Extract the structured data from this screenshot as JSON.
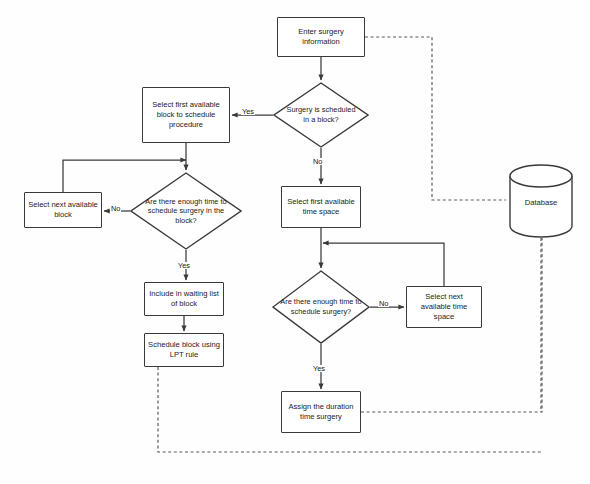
{
  "diagram": {
    "type": "flowchart",
    "background_color": "#fefefe",
    "stroke_color": "#3a3a3a",
    "text_color": "#1a1a1a"
  },
  "nodes": [
    {
      "id": "enter_surgery",
      "shape": "process",
      "label": "Enter surgery information",
      "x": 277,
      "y": 17,
      "w": 88,
      "h": 40
    },
    {
      "id": "surgery_scheduled",
      "shape": "decision",
      "label": "Surgery is scheduled in a block?",
      "x": 273,
      "y": 82,
      "w": 96,
      "h": 66
    },
    {
      "id": "select_first_block",
      "shape": "process",
      "label": "Select first available block to schedule procedure",
      "x": 142,
      "y": 87,
      "w": 88,
      "h": 56
    },
    {
      "id": "enough_time_block",
      "shape": "decision",
      "label": "Are there enough time to schedule surgery in the block?",
      "x": 130,
      "y": 172,
      "w": 112,
      "h": 78
    },
    {
      "id": "select_next_block",
      "shape": "process",
      "label": "Select next available block",
      "x": 24,
      "y": 192,
      "w": 78,
      "h": 36
    },
    {
      "id": "include_waiting",
      "shape": "process",
      "label": "Include in waiting list of block",
      "x": 144,
      "y": 282,
      "w": 80,
      "h": 34
    },
    {
      "id": "schedule_lpt",
      "shape": "process",
      "label": "Schedule block using LPT rule",
      "x": 144,
      "y": 333,
      "w": 80,
      "h": 34
    },
    {
      "id": "select_first_time",
      "shape": "process",
      "label": "Select first available time space",
      "x": 281,
      "y": 186,
      "w": 80,
      "h": 42
    },
    {
      "id": "enough_time_surg",
      "shape": "decision",
      "label": "Are there enough time to schedule surgery?",
      "x": 272,
      "y": 270,
      "w": 98,
      "h": 74
    },
    {
      "id": "select_next_time",
      "shape": "process",
      "label": "Select next available time space",
      "x": 406,
      "y": 286,
      "w": 76,
      "h": 42
    },
    {
      "id": "assign_duration",
      "shape": "process",
      "label": "Assign the duration time surgery",
      "x": 281,
      "y": 391,
      "w": 80,
      "h": 42
    },
    {
      "id": "database",
      "shape": "cylinder",
      "label": "Database",
      "x": 508,
      "y": 164,
      "w": 66,
      "h": 74
    }
  ],
  "edge_labels": [
    {
      "id": "yes_block",
      "text": "Yes",
      "x": 241,
      "y": 108
    },
    {
      "id": "no_block",
      "text": "No",
      "x": 312,
      "y": 158
    },
    {
      "id": "no_enough_blk",
      "text": "No",
      "x": 110,
      "y": 205
    },
    {
      "id": "yes_enough_blk",
      "text": "Yes",
      "x": 177,
      "y": 262
    },
    {
      "id": "no_enough_time",
      "text": "No",
      "x": 378,
      "y": 300
    },
    {
      "id": "yes_enough_tm",
      "text": "Yes",
      "x": 312,
      "y": 365
    }
  ],
  "connectors": [
    {
      "from": "enter_surgery",
      "to": "surgery_scheduled",
      "style": "solid"
    },
    {
      "from": "surgery_scheduled",
      "to": "select_first_block",
      "style": "solid",
      "label": "Yes"
    },
    {
      "from": "surgery_scheduled",
      "to": "select_first_time",
      "style": "solid",
      "label": "No"
    },
    {
      "from": "select_first_block",
      "to": "enough_time_block",
      "style": "solid"
    },
    {
      "from": "enough_time_block",
      "to": "select_next_block",
      "style": "solid",
      "label": "No"
    },
    {
      "from": "select_next_block",
      "to": "select_first_block",
      "style": "solid"
    },
    {
      "from": "enough_time_block",
      "to": "include_waiting",
      "style": "solid",
      "label": "Yes"
    },
    {
      "from": "include_waiting",
      "to": "schedule_lpt",
      "style": "solid"
    },
    {
      "from": "select_first_time",
      "to": "enough_time_surg",
      "style": "solid"
    },
    {
      "from": "enough_time_surg",
      "to": "select_next_time",
      "style": "solid",
      "label": "No"
    },
    {
      "from": "select_next_time",
      "to": "select_first_time",
      "style": "solid"
    },
    {
      "from": "enough_time_surg",
      "to": "assign_duration",
      "style": "solid",
      "label": "Yes"
    },
    {
      "from": "enter_surgery",
      "to": "database",
      "style": "dashed"
    },
    {
      "from": "assign_duration",
      "to": "database",
      "style": "dashed"
    },
    {
      "from": "schedule_lpt",
      "to": "database",
      "style": "dashed"
    }
  ]
}
